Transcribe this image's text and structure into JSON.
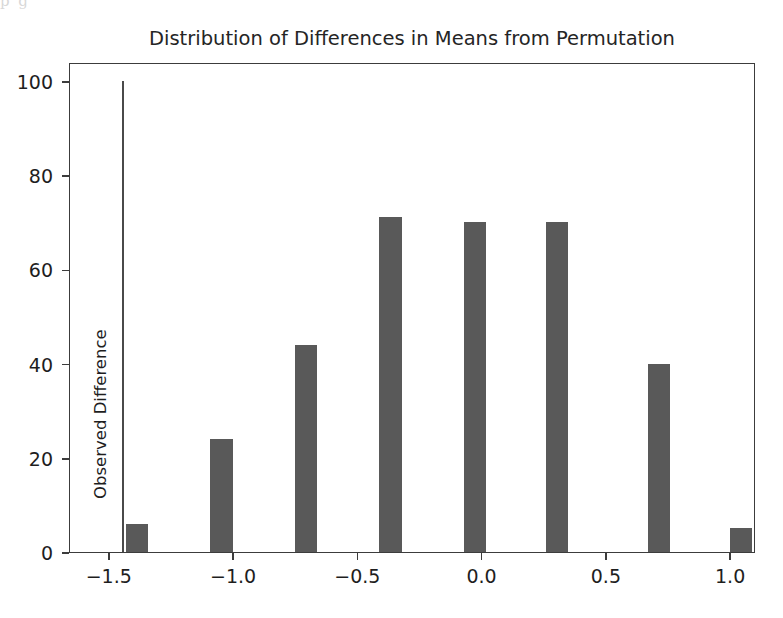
{
  "page_bleed_text": "p                                   g",
  "figure": {
    "title": "Distribution of Differences in Means from Permutation",
    "xlabel": "",
    "ylabel": "",
    "bar_color": "#595959",
    "axis_color": "#3c3c3c",
    "observed_difference": {
      "label": "Observed Difference",
      "value": -1.45,
      "top_value": 100,
      "color": "#4a4a4a"
    }
  },
  "chart_data": {
    "type": "bar",
    "title": "Distribution of Differences in Means from Permutation",
    "xlabel": "",
    "ylabel": "",
    "xlim": [
      -1.66,
      1.1
    ],
    "ylim": [
      0,
      104
    ],
    "grid": false,
    "legend": null,
    "bar_width": 0.09,
    "x": [
      -1.39,
      -1.05,
      -0.71,
      -0.37,
      -0.03,
      0.3,
      0.71,
      1.04
    ],
    "values": [
      6,
      24,
      44,
      71,
      70,
      70,
      40,
      5
    ],
    "categories": [
      "-1.39",
      "-1.05",
      "-0.71",
      "-0.37",
      "-0.03",
      "0.30",
      "0.71",
      "1.04"
    ],
    "xticks": [
      -1.5,
      -1.0,
      -0.5,
      0.0,
      0.5,
      1.0
    ],
    "xticklabels": [
      "−1.5",
      "−1.0",
      "−0.5",
      "0.0",
      "0.5",
      "1.0"
    ],
    "yticks": [
      0,
      20,
      40,
      60,
      80,
      100
    ],
    "yticklabels": [
      "0",
      "20",
      "40",
      "60",
      "80",
      "100"
    ],
    "annotations": [
      {
        "text": "Observed Difference",
        "x": -1.45,
        "y_from": 0,
        "y_to": 100,
        "type": "vertical-line-with-rotated-label"
      }
    ]
  }
}
